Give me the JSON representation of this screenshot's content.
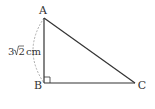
{
  "diagram": {
    "type": "right-triangle",
    "vertices": {
      "A": {
        "label": "A",
        "x": 44,
        "y": 18
      },
      "B": {
        "label": "B",
        "x": 44,
        "y": 83
      },
      "C": {
        "label": "C",
        "x": 135,
        "y": 83
      }
    },
    "right_angle_at": "B",
    "side_AB_length": {
      "coefficient": "3",
      "radicand": "2",
      "unit": "cm",
      "text": "3√2 cm"
    },
    "colors": {
      "line": "#333333",
      "arc": "#999999",
      "text": "#333333"
    }
  }
}
